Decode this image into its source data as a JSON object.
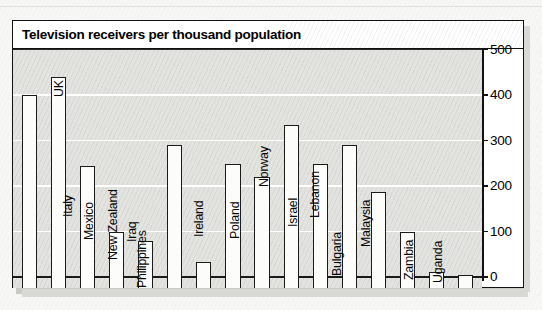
{
  "chart_data": {
    "type": "bar",
    "title": "Television receivers per thousand population",
    "xlabel": "",
    "ylabel": "",
    "ylim": [
      0,
      500
    ],
    "yticks": [
      0,
      100,
      200,
      300,
      400,
      500
    ],
    "grid": true,
    "legend": "none",
    "orientation": "vertical",
    "label_orientation": "rotated-90",
    "categories": [
      "France",
      "UK",
      "Italy",
      "Mexico",
      "Iraq",
      "New Zealand",
      "Philippines",
      "Ireland",
      "Poland",
      "Norway",
      "Israel",
      "Lebanon",
      "Bulgaria",
      "Malaysia",
      "Zambia",
      "Uganda"
    ],
    "values": [
      400,
      440,
      245,
      100,
      80,
      290,
      33,
      248,
      220,
      335,
      248,
      290,
      186,
      100,
      12,
      5
    ],
    "unit": "receivers per thousand population"
  },
  "axis": {
    "tick_labels": [
      "500",
      "400",
      "300",
      "200",
      "100",
      "0"
    ]
  },
  "colors": {
    "plot_background": "#e3e3e0",
    "bar_fill": "#fcfcfa",
    "bar_stroke": "#1b1b1b",
    "gridline": "#ffffff",
    "frame": "#111111",
    "title_background": "#ffffff",
    "text": "#000000"
  }
}
